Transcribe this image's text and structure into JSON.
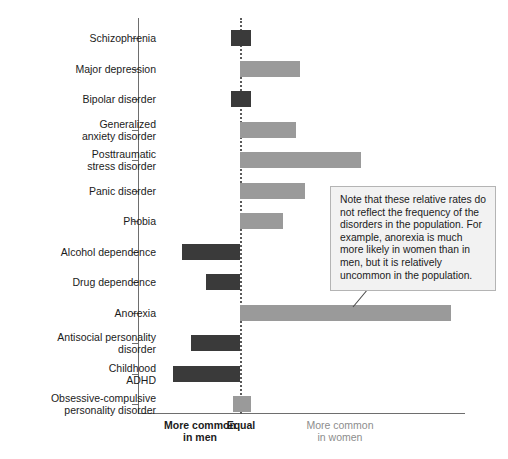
{
  "chart_data": {
    "type": "bar",
    "orientation": "horizontal",
    "title": "",
    "xlabel": "",
    "ylabel": "",
    "grid": false,
    "legend": null,
    "zero_label": "Equal",
    "axis_captions": {
      "left": "More common\nin men",
      "center": "Equal",
      "right": "More common\nin women"
    },
    "xlim": [
      -100,
      100
    ],
    "note": "Bars extend left for disorders more common in men and right for disorders more common in women; value is relative sex ratio on an unlabeled scale.",
    "colors": {
      "more_common_in_men": "#3a3a3a",
      "more_common_in_women": "#9a9a9a",
      "axis": "#6e6e6e",
      "zero_line": "#5a5a5a",
      "annotation_background": "#f2f2f2",
      "annotation_border": "#b4b4b4",
      "text": "#1b1b1b",
      "muted_text": "#8d8d8d"
    },
    "categories": [
      "Schizophrenia",
      "Major depression",
      "Bipolar disorder",
      "Generalized\nanxiety disorder",
      "Posttraumatic\nstress disorder",
      "Panic disorder",
      "Phobia",
      "Alcohol dependence",
      "Drug dependence",
      "Anorexia",
      "Antisocial personality\ndisorder",
      "Childhood\nADHD",
      "Obsessive-compulsive\npersonality disorder"
    ],
    "bars": [
      {
        "label": "Schizophrenia",
        "start": -4,
        "end": 5,
        "direction": "men"
      },
      {
        "label": "Major depression",
        "start": 0,
        "end": 27,
        "direction": "women"
      },
      {
        "label": "Bipolar disorder",
        "start": -4,
        "end": 5,
        "direction": "men"
      },
      {
        "label": "Generalized anxiety disorder",
        "start": 0,
        "end": 25,
        "direction": "women"
      },
      {
        "label": "Posttraumatic stress disorder",
        "start": 0,
        "end": 54,
        "direction": "women"
      },
      {
        "label": "Panic disorder",
        "start": 0,
        "end": 29,
        "direction": "women"
      },
      {
        "label": "Phobia",
        "start": 0,
        "end": 19,
        "direction": "women"
      },
      {
        "label": "Alcohol dependence",
        "start": -26,
        "end": 0,
        "direction": "men"
      },
      {
        "label": "Drug dependence",
        "start": -15,
        "end": 0,
        "direction": "men"
      },
      {
        "label": "Anorexia",
        "start": 0,
        "end": 94,
        "direction": "women"
      },
      {
        "label": "Antisocial personality disorder",
        "start": -22,
        "end": 0,
        "direction": "men"
      },
      {
        "label": "Childhood ADHD",
        "start": -30,
        "end": 0,
        "direction": "men"
      },
      {
        "label": "Obsessive-compulsive personality disorder",
        "start": -3,
        "end": 5,
        "direction": "women"
      }
    ],
    "annotation": "Note that these relative rates do not reflect the frequency of the disorders in the population. For example, anorexia is much more likely in women than in men, but it is relatively uncommon in the population."
  }
}
